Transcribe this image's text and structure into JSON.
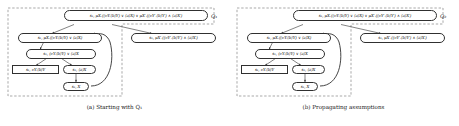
{
  "figure": {
    "panels": [
      {
        "id": "a",
        "caption": "(a) Starting with Q₁",
        "region_label": "Q₁",
        "nodes": [
          {
            "id": "a-n1",
            "text": "s₁, μX.((νY.⟨b⟩Y) ∨ ⟨a⟩X) ∨ μX′.((νY′.⟨b⟩Y′) ∧ ⟨a⟩X′)",
            "shape": "rounded"
          },
          {
            "id": "a-n2",
            "text": "s₁, μX.((νY.⟨b⟩Y) ∨ ⟨a⟩X)",
            "shape": "rounded"
          },
          {
            "id": "a-n3",
            "text": "s₁, μX′.((νY′.⟨b⟩Y′) ∧ ⟨a⟩X′)",
            "shape": "rounded"
          },
          {
            "id": "a-n4",
            "text": "s₁, (νY.⟨b⟩Y) ∨ ⟨a⟩X",
            "shape": "rounded"
          },
          {
            "id": "a-n5",
            "text": "s₁, νY.⟨b⟩Y",
            "shape": "rect"
          },
          {
            "id": "a-n6",
            "text": "s₁, ⟨a⟩X",
            "shape": "rounded"
          },
          {
            "id": "a-n7",
            "text": "s₁, X",
            "shape": "rounded"
          }
        ]
      },
      {
        "id": "b",
        "caption": "(b) Propagating assumptions",
        "region_label": "Q₂",
        "nodes": [
          {
            "id": "b-n1",
            "text": "s₁, μX.((νY.⟨b⟩Y) ∨ ⟨a⟩X) ∨ μX′.((νY′.⟨b⟩Y′) ∧ ⟨a⟩X′)",
            "shape": "rounded"
          },
          {
            "id": "b-n2",
            "text": "s₁, μX.((νY.⟨b⟩Y) ∨ ⟨a⟩X)",
            "shape": "rounded"
          },
          {
            "id": "b-n3",
            "text": "s₁, μX′.((νY′.⟨b⟩Y′) ∧ ⟨a⟩X′)",
            "shape": "rounded"
          },
          {
            "id": "b-n4",
            "text": "s₁, (νY.⟨b⟩Y) ∨ ⟨a⟩X",
            "shape": "rounded"
          },
          {
            "id": "b-n5",
            "text": "s₁, νY.⟨b⟩Y",
            "shape": "rect"
          },
          {
            "id": "b-n6",
            "text": "s₁, ⟨a⟩X",
            "shape": "rounded"
          },
          {
            "id": "b-n7",
            "text": "s₁, X",
            "shape": "rounded"
          }
        ]
      }
    ]
  },
  "colors": {
    "node_border": "#303030",
    "dashed_region": "#6e6e6e",
    "arrow": "#303030",
    "text": "#141414",
    "background": "#ffffff"
  }
}
